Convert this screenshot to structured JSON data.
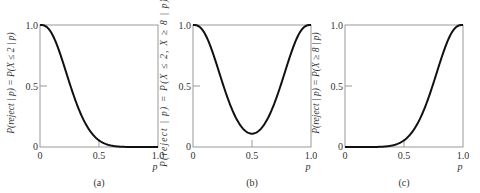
{
  "chart_data": [
    {
      "type": "line",
      "panel": "(a)",
      "title": "",
      "xlabel": "p",
      "ylabel": "P(reject | p) = P(X ≤ 2 | p)",
      "x": [
        0,
        0.1,
        0.2,
        0.3,
        0.4,
        0.5,
        0.6,
        0.7,
        0.8,
        0.9,
        1.0
      ],
      "values": [
        1.0,
        0.93,
        0.678,
        0.383,
        0.167,
        0.055,
        0.012,
        0.002,
        0.0,
        0.0,
        0.0
      ],
      "xlim": [
        0,
        1
      ],
      "ylim": [
        0,
        1
      ],
      "xticks": [
        "0",
        "0.5",
        "1.0"
      ],
      "yticks": [
        "0",
        "0.5",
        "1.0"
      ],
      "grid": false,
      "caption": "(a)"
    },
    {
      "type": "line",
      "panel": "(b)",
      "title": "",
      "xlabel": "p",
      "ylabel": "P(reject | p) = P(X ≤ 2, X ≥ 8 | p)",
      "x": [
        0,
        0.1,
        0.2,
        0.3,
        0.4,
        0.5,
        0.6,
        0.7,
        0.8,
        0.9,
        1.0
      ],
      "values": [
        1.0,
        0.93,
        0.678,
        0.385,
        0.179,
        0.109,
        0.179,
        0.385,
        0.678,
        0.93,
        1.0
      ],
      "xlim": [
        0,
        1
      ],
      "ylim": [
        0,
        1
      ],
      "xticks": [
        "0",
        "0.5",
        "1.0"
      ],
      "yticks": [
        "0",
        "0.5",
        "1.0"
      ],
      "grid": false,
      "caption": "(b)"
    },
    {
      "type": "line",
      "panel": "(c)",
      "title": "",
      "xlabel": "p",
      "ylabel": "P(reject | p) = P(X ≥ 8 | p)",
      "x": [
        0,
        0.1,
        0.2,
        0.3,
        0.4,
        0.5,
        0.6,
        0.7,
        0.8,
        0.9,
        1.0
      ],
      "values": [
        0.0,
        0.0,
        0.0,
        0.002,
        0.012,
        0.055,
        0.167,
        0.383,
        0.678,
        0.93,
        1.0
      ],
      "xlim": [
        0,
        1
      ],
      "ylim": [
        0,
        1
      ],
      "xticks": [
        "0",
        "0.5",
        "1.0"
      ],
      "yticks": [
        "0",
        "0.5",
        "1.0"
      ],
      "grid": false,
      "caption": "(c)"
    }
  ],
  "panels": [
    {
      "ylabel": "P(reject | p) = P(X ≤ 2 | p)",
      "caption": "(a)",
      "xlabel": "p",
      "ticks": {
        "x0": "0",
        "xmid": "0.5",
        "x1": "1.0",
        "y0": "0",
        "ymid": "0.5",
        "y1": "1.0"
      }
    },
    {
      "ylabel": "P(reject | p) = P(X ≤ 2, X ≥ 8 | p)",
      "caption": "(b)",
      "xlabel": "p",
      "ticks": {
        "x0": "0",
        "xmid": "0.5",
        "x1": "1.0",
        "y0": "0",
        "ymid": "0.5",
        "y1": "1.0"
      }
    },
    {
      "ylabel": "P(reject | p) = P(X ≥ 8 | p)",
      "caption": "(c)",
      "xlabel": "p",
      "ticks": {
        "x0": "0",
        "xmid": "0.5",
        "x1": "1.0",
        "y0": "0",
        "ymid": "0.5",
        "y1": "1.0"
      }
    }
  ],
  "colors": {
    "curve": "#111111",
    "frame": "#999999",
    "text": "#333333"
  }
}
